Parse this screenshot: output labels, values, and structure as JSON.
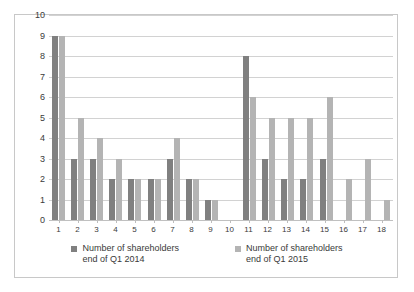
{
  "chart_data": {
    "type": "bar",
    "title": "",
    "subtitle": "",
    "xlabel": "",
    "ylabel": "",
    "ylim": [
      0,
      10
    ],
    "ytick_step": 1,
    "yticks": [
      "10",
      "9",
      "8",
      "7",
      "6",
      "5",
      "4",
      "3",
      "2",
      "1",
      "0"
    ],
    "grid": true,
    "legend_position": "bottom",
    "categories": [
      "1",
      "2",
      "3",
      "4",
      "5",
      "6",
      "7",
      "8",
      "9",
      "10",
      "11",
      "12",
      "13",
      "14",
      "15",
      "16",
      "17",
      "18"
    ],
    "series": [
      {
        "name": "Number of shareholders\nend of Q1 2014",
        "color": "#808080",
        "values": [
          9,
          3,
          3,
          2,
          2,
          2,
          3,
          2,
          1,
          0,
          8,
          3,
          2,
          2,
          3,
          0,
          0,
          0
        ]
      },
      {
        "name": "Number of shareholders\nend of Q1 2015",
        "color": "#b4b4b4",
        "values": [
          9,
          5,
          4,
          3,
          2,
          2,
          4,
          2,
          1,
          0,
          6,
          5,
          5,
          5,
          6,
          2,
          3,
          1
        ]
      }
    ]
  },
  "legend": {
    "entries": [
      {
        "label": "Number of shareholders\nend of Q1 2014",
        "color": "#808080"
      },
      {
        "label": "Number of shareholders\nend of Q1 2015",
        "color": "#b4b4b4"
      }
    ]
  },
  "colors": {
    "series_2014": "#808080",
    "series_2015": "#b4b4b4",
    "gridline": "#d2d2d2",
    "border": "#c8c8c8",
    "background": "#ffffff"
  }
}
